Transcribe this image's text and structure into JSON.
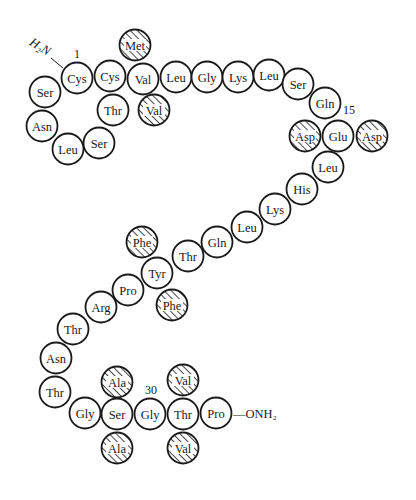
{
  "diagram": {
    "type": "peptide-sequence",
    "colors": {
      "stroke": "#1a1a1a",
      "fill": "#ffffff",
      "hatch": "#1a1a1a",
      "background": "#ffffff"
    },
    "radius": 15.5,
    "n_terminus": {
      "label": "H₂N",
      "x": 38,
      "y": 50,
      "rotate": 32
    },
    "c_terminus": {
      "label": "—ONH₂",
      "x": 233,
      "y": 418
    },
    "position_labels": [
      {
        "text": "1",
        "x": 77,
        "y": 58
      },
      {
        "text": "15",
        "x": 349,
        "y": 114
      },
      {
        "text": "30",
        "x": 151,
        "y": 394
      }
    ],
    "residues": [
      {
        "label": "Cys",
        "x": 77,
        "y": 78,
        "hatched": false,
        "chain": true
      },
      {
        "label": "Ser",
        "x": 45,
        "y": 92,
        "hatched": false,
        "chain": true
      },
      {
        "label": "Asn",
        "x": 42,
        "y": 126,
        "hatched": false,
        "chain": true
      },
      {
        "label": "Leu",
        "x": 68,
        "y": 149,
        "hatched": false,
        "chain": true
      },
      {
        "label": "Ser",
        "x": 99,
        "y": 143,
        "hatched": false,
        "chain": true
      },
      {
        "label": "Thr",
        "x": 113,
        "y": 110,
        "hatched": false,
        "chain": true
      },
      {
        "label": "Cys",
        "x": 110,
        "y": 76,
        "hatched": false,
        "chain": true
      },
      {
        "label": "Met",
        "x": 135,
        "y": 45,
        "hatched": true,
        "chain": false
      },
      {
        "label": "Val",
        "x": 143,
        "y": 79,
        "hatched": false,
        "chain": true
      },
      {
        "label": "Val",
        "x": 154,
        "y": 110,
        "hatched": true,
        "chain": false
      },
      {
        "label": "Leu",
        "x": 176,
        "y": 77,
        "hatched": false,
        "chain": true
      },
      {
        "label": "Gly",
        "x": 207,
        "y": 77,
        "hatched": false,
        "chain": true
      },
      {
        "label": "Lys",
        "x": 238,
        "y": 77,
        "hatched": false,
        "chain": true
      },
      {
        "label": "Leu",
        "x": 269,
        "y": 75,
        "hatched": false,
        "chain": true
      },
      {
        "label": "Ser",
        "x": 298,
        "y": 84,
        "hatched": false,
        "chain": true
      },
      {
        "label": "Gln",
        "x": 325,
        "y": 103,
        "hatched": false,
        "chain": true
      },
      {
        "label": "Asp",
        "x": 305,
        "y": 136,
        "hatched": true,
        "chain": false
      },
      {
        "label": "Glu",
        "x": 338,
        "y": 136,
        "hatched": false,
        "chain": true
      },
      {
        "label": "Asp",
        "x": 372,
        "y": 136,
        "hatched": true,
        "chain": false
      },
      {
        "label": "Leu",
        "x": 328,
        "y": 167,
        "hatched": false,
        "chain": true
      },
      {
        "label": "His",
        "x": 302,
        "y": 189,
        "hatched": false,
        "chain": true
      },
      {
        "label": "Lys",
        "x": 275,
        "y": 209,
        "hatched": false,
        "chain": true
      },
      {
        "label": "Leu",
        "x": 247,
        "y": 227,
        "hatched": false,
        "chain": true
      },
      {
        "label": "Gln",
        "x": 217,
        "y": 242,
        "hatched": false,
        "chain": true
      },
      {
        "label": "Thr",
        "x": 188,
        "y": 256,
        "hatched": false,
        "chain": true
      },
      {
        "label": "Phe",
        "x": 142,
        "y": 242,
        "hatched": true,
        "chain": false
      },
      {
        "label": "Tyr",
        "x": 157,
        "y": 273,
        "hatched": false,
        "chain": true
      },
      {
        "label": "Phe",
        "x": 172,
        "y": 305,
        "hatched": true,
        "chain": false
      },
      {
        "label": "Pro",
        "x": 128,
        "y": 290,
        "hatched": false,
        "chain": true
      },
      {
        "label": "Arg",
        "x": 101,
        "y": 307,
        "hatched": false,
        "chain": true
      },
      {
        "label": "Thr",
        "x": 73,
        "y": 329,
        "hatched": false,
        "chain": true
      },
      {
        "label": "Asn",
        "x": 56,
        "y": 358,
        "hatched": false,
        "chain": true
      },
      {
        "label": "Thr",
        "x": 55,
        "y": 392,
        "hatched": false,
        "chain": true
      },
      {
        "label": "Gly",
        "x": 85,
        "y": 413,
        "hatched": false,
        "chain": true
      },
      {
        "label": "Ala",
        "x": 117,
        "y": 382,
        "hatched": true,
        "chain": false
      },
      {
        "label": "Ser",
        "x": 117,
        "y": 414,
        "hatched": false,
        "chain": true
      },
      {
        "label": "Ala",
        "x": 117,
        "y": 448,
        "hatched": true,
        "chain": false
      },
      {
        "label": "Gly",
        "x": 150,
        "y": 414,
        "hatched": false,
        "chain": true
      },
      {
        "label": "Val",
        "x": 183,
        "y": 380,
        "hatched": true,
        "chain": false
      },
      {
        "label": "Thr",
        "x": 183,
        "y": 414,
        "hatched": false,
        "chain": true
      },
      {
        "label": "Val",
        "x": 183,
        "y": 448,
        "hatched": true,
        "chain": false
      },
      {
        "label": "Pro",
        "x": 216,
        "y": 413,
        "hatched": false,
        "chain": true
      }
    ]
  }
}
